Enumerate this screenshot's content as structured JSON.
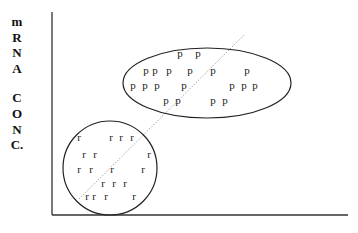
{
  "diagram": {
    "y_axis_label_lines": [
      "m",
      "R",
      "N",
      "A",
      "",
      "C",
      "O",
      "N",
      "C."
    ],
    "y_axis_label": "mRNA CONC.",
    "x_axis_label": "",
    "cluster_p": {
      "symbol": "p",
      "shape": "ellipse",
      "points": [
        [
          180,
          57
        ],
        [
          198,
          57
        ],
        [
          146,
          74
        ],
        [
          155,
          74
        ],
        [
          169,
          74
        ],
        [
          190,
          74
        ],
        [
          213,
          74
        ],
        [
          247,
          74
        ],
        [
          133,
          89
        ],
        [
          145,
          89
        ],
        [
          157,
          89
        ],
        [
          184,
          89
        ],
        [
          232,
          89
        ],
        [
          244,
          89
        ],
        [
          255,
          89
        ],
        [
          166,
          104
        ],
        [
          178,
          104
        ],
        [
          213,
          104
        ],
        [
          225,
          104
        ]
      ]
    },
    "cluster_r": {
      "symbol": "r",
      "shape": "circle",
      "points": [
        [
          79,
          141
        ],
        [
          111,
          141
        ],
        [
          121,
          141
        ],
        [
          132,
          141
        ],
        [
          84,
          158
        ],
        [
          95,
          158
        ],
        [
          149,
          158
        ],
        [
          79,
          173
        ],
        [
          91,
          173
        ],
        [
          112,
          173
        ],
        [
          143,
          173
        ],
        [
          103,
          187
        ],
        [
          114,
          187
        ],
        [
          125,
          187
        ],
        [
          87,
          200
        ],
        [
          94,
          200
        ],
        [
          106,
          200
        ],
        [
          134,
          200
        ]
      ]
    },
    "colors": {
      "line": "#222222",
      "dotted": "#888888",
      "text": "#111111"
    }
  }
}
